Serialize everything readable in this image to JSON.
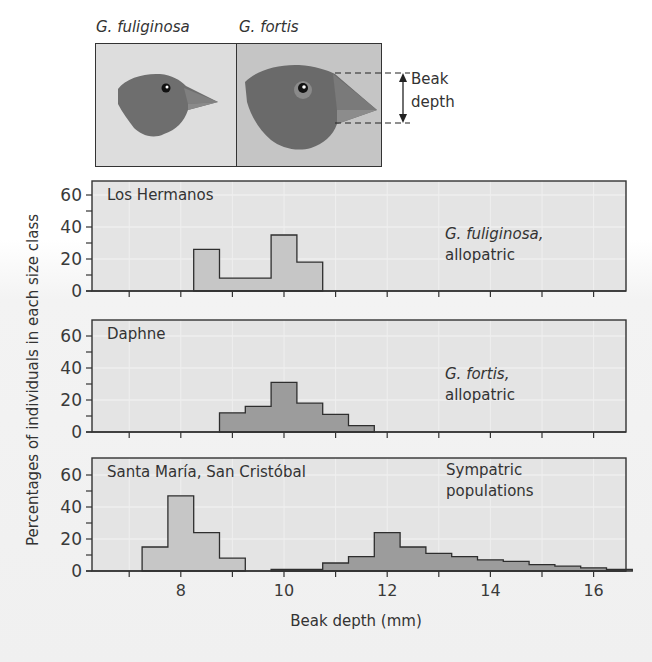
{
  "header": {
    "species_left": "G. fuliginosa",
    "species_right": "G. fortis",
    "beak_annotation_line1": "Beak",
    "beak_annotation_line2": "depth"
  },
  "panels": [
    {
      "title": "Los Hermanos",
      "note_species": "G. fuliginosa,",
      "note_status": "allopatric"
    },
    {
      "title": "Daphne",
      "note_species": "G. fortis,",
      "note_status": "allopatric"
    },
    {
      "title": "Santa María, San Cristóbal",
      "note_species": "Sympatric",
      "note_status": "populations"
    }
  ],
  "axes": {
    "ylabel": "Percentages of individuals in each size class",
    "xlabel": "Beak depth (mm)",
    "y_ticks": [
      0,
      20,
      40,
      60
    ],
    "x_ticks": [
      8,
      10,
      12,
      14,
      16
    ]
  },
  "colors": {
    "panel_bg": "#e4e4e4",
    "fuliginosa_bar": "#c6c6c6",
    "fortis_bar": "#9c9c9c",
    "axis": "#333333",
    "photo_left_bg": "#dddddd",
    "photo_right_bg": "#c5c5c5",
    "bird": "#6e6e6e"
  },
  "chart_data": {
    "type": "bar",
    "title": "",
    "xlabel": "Beak depth (mm)",
    "ylabel": "Percentages of individuals in each size class",
    "xlim": [
      6.25,
      16.6
    ],
    "ylim": [
      0,
      65
    ],
    "x_tick_labels": [
      "8",
      "10",
      "12",
      "14",
      "16"
    ],
    "y_tick_labels": [
      "0",
      "20",
      "40",
      "60"
    ],
    "bin_width": 0.5,
    "grid": false,
    "subplots": [
      {
        "title": "Los Hermanos",
        "annotation": "G. fuliginosa, allopatric",
        "series": [
          {
            "name": "G. fuliginosa",
            "bin_starts": [
              8.25,
              8.75,
              9.25,
              9.75,
              10.25
            ],
            "values": [
              26,
              8,
              8,
              35,
              18
            ]
          }
        ]
      },
      {
        "title": "Daphne",
        "annotation": "G. fortis, allopatric",
        "series": [
          {
            "name": "G. fortis",
            "bin_starts": [
              8.75,
              9.25,
              9.75,
              10.25,
              10.75,
              11.25
            ],
            "values": [
              12,
              16,
              31,
              18,
              11,
              4
            ]
          }
        ]
      },
      {
        "title": "Santa María, San Cristóbal",
        "annotation": "Sympatric populations",
        "series": [
          {
            "name": "G. fuliginosa",
            "bin_starts": [
              7.25,
              7.75,
              8.25,
              8.75
            ],
            "values": [
              15,
              47,
              24,
              8
            ]
          },
          {
            "name": "G. fortis",
            "bin_starts": [
              9.75,
              10.25,
              10.75,
              11.25,
              11.75,
              12.25,
              12.75,
              13.25,
              13.75,
              14.25,
              14.75,
              15.25,
              15.75,
              16.25
            ],
            "values": [
              1,
              1,
              5,
              9,
              24,
              15,
              11,
              9,
              7,
              6,
              4,
              3,
              2,
              1
            ]
          }
        ]
      }
    ]
  }
}
